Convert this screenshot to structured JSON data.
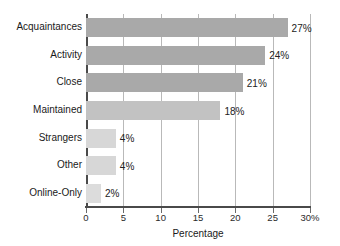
{
  "chart_data": {
    "type": "bar",
    "orientation": "horizontal",
    "title": "",
    "xlabel": "Percentage",
    "ylabel": "",
    "categories": [
      "Acquaintances",
      "Activity",
      "Close",
      "Maintained",
      "Strangers",
      "Other",
      "Online-Only"
    ],
    "values": [
      27,
      24,
      21,
      18,
      4,
      4,
      2
    ],
    "data_labels": [
      "27%",
      "24%",
      "21%",
      "18%",
      "4%",
      "4%",
      "2%"
    ],
    "xlim": [
      0,
      30
    ],
    "xticks": [
      0,
      5,
      10,
      15,
      20,
      25,
      30
    ],
    "xtick_labels": [
      "0",
      "5",
      "10",
      "15",
      "20",
      "25",
      "30%"
    ],
    "grid": "vertical",
    "legend": "none",
    "bar_colors": [
      "#a9a9a9",
      "#a9a9a9",
      "#a9a9a9",
      "#c2c2c2",
      "#d7d7d7",
      "#d7d7d7",
      "#dcdcdc"
    ],
    "colors": {
      "background": "#ffffff",
      "axis": "#4a4a4a",
      "gridline": "#b9b9b9",
      "text": "#1a1a1a"
    }
  }
}
